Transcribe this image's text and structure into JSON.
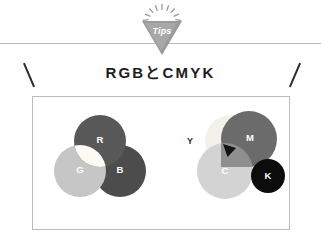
{
  "page": {
    "background_color": "#ffffff",
    "rule_color": "#b9b9b9"
  },
  "badge": {
    "label": "Tips",
    "shape": "downward-triangle",
    "fill_color": "#a8a8a8",
    "outline_color": "#9a9a9a",
    "text_color": "#ffffff",
    "ray_count": 9
  },
  "heading": {
    "text": "RGBとCMYK",
    "color": "#1d1d1d"
  },
  "decor": {
    "tick_left": "\\",
    "tick_right": "/",
    "tick_color": "#2b2b2b"
  },
  "panel": {
    "border_color": "#bcbcbc",
    "background_color": "#ffffff"
  },
  "diagrams": {
    "rgb": {
      "title": "RGB",
      "model": "additive",
      "center_overlap_color": "#fbfbf4",
      "circles": [
        {
          "label": "R",
          "name": "red",
          "color": "#585858",
          "label_color": "#ffffff"
        },
        {
          "label": "G",
          "name": "green",
          "color": "#c6c6c6",
          "label_color": "#ffffff"
        },
        {
          "label": "B",
          "name": "blue",
          "color": "#4c4c4c",
          "label_color": "#ffffff"
        }
      ]
    },
    "cmyk": {
      "title": "CMYK",
      "model": "subtractive",
      "center_overlap_color": "#121212",
      "circles": [
        {
          "label": "Y",
          "name": "yellow",
          "color": "#f2f1ea",
          "label_color": "#2b2b2b",
          "label_position": "outside-left"
        },
        {
          "label": "M",
          "name": "magenta",
          "color": "#6b6b6b",
          "label_color": "#ffffff",
          "label_position": "inside"
        },
        {
          "label": "C",
          "name": "cyan",
          "color": "#d3d3d3",
          "label_color": "#ffffff",
          "label_position": "inside"
        },
        {
          "label": "K",
          "name": "key-black",
          "color": "#0c0c0c",
          "label_color": "#ffffff",
          "label_position": "inside"
        }
      ]
    }
  }
}
